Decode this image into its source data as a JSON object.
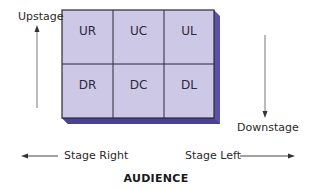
{
  "diagram": {
    "colors": {
      "cell_fill": "#cdc8e6",
      "extrusion": "#5b52a3",
      "extrusion_dark": "#3f3880",
      "grid_line": "#2a2a3a",
      "arrow": "#555555"
    },
    "grid": {
      "rows": [
        [
          "UR",
          "UC",
          "UL"
        ],
        [
          "DR",
          "DC",
          "DL"
        ]
      ]
    },
    "labels": {
      "upstage": "Upstage",
      "downstage": "Downstage",
      "stage_right": "Stage Right",
      "stage_left": "Stage Left",
      "audience": "AUDIENCE"
    }
  }
}
